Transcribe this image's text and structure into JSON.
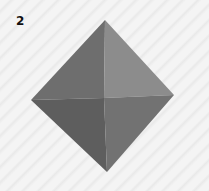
{
  "figure": {
    "label": "2",
    "colors": {
      "top_left_face": "#6e6e6e",
      "top_right_face": "#8c8c8c",
      "bottom_left_face": "#5e5e5e",
      "bottom_right_face": "#727272",
      "background": "#f2f2f2"
    }
  }
}
